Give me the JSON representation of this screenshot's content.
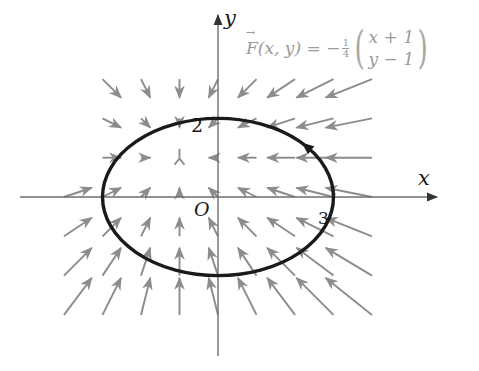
{
  "diagram": {
    "type": "vector_field_with_closed_curve",
    "axes": {
      "x_label": "x",
      "y_label": "y",
      "origin_label": "O",
      "origin_px": [
        218,
        197
      ],
      "unit_px_x": 38.5,
      "unit_px_y": 39.3,
      "x_axis_px": [
        20,
        437
      ],
      "y_axis_px": [
        356,
        15
      ]
    },
    "ticks": {
      "y_intercept_label": "2",
      "x_intercept_label": "3"
    },
    "formula": {
      "lhs": "F(x, y) = −",
      "frac_num": "1",
      "frac_den": "4",
      "row1": "x + 1",
      "row2": "y − 1"
    },
    "vector_field": {
      "expression": "F(x,y) = -1/4 (x+1, y-1)",
      "x_range": [
        -4,
        4
      ],
      "y_range": [
        -3,
        3
      ],
      "step": 1,
      "arrow_scale_px": 37,
      "exclude_points": [
        [
          -4,
          1
        ],
        [
          -4,
          2
        ],
        [
          -4,
          3
        ]
      ],
      "arrow_color": "#8c8c8c"
    },
    "curve": {
      "type": "ellipse",
      "center": [
        0,
        0
      ],
      "semi_axis_x": 3,
      "semi_axis_y": 2,
      "orientation": "counterclockwise",
      "color": "#1a1a1a",
      "direction_arrow_at_deg": 40
    },
    "colors": {
      "axis": "#6e6e6e",
      "formula": "#9a9a9a"
    }
  }
}
